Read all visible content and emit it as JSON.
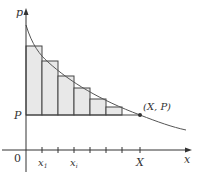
{
  "diagram": {
    "type": "riemann-sum-consumer-surplus",
    "labels": {
      "y_axis": "p",
      "x_axis": "x",
      "origin": "0",
      "price_level": "P",
      "point": "(X, P)",
      "x1": "x",
      "x1_sub": "1",
      "xi": "x",
      "xi_sub": "i",
      "X": "X"
    },
    "colors": {
      "axis": "#333333",
      "curve": "#555555",
      "rect_fill": "#e8e8e8",
      "rect_stroke": "#444444",
      "point": "#333333"
    },
    "rectangles": [
      {
        "x0": 26,
        "x1": 42,
        "top": 46
      },
      {
        "x0": 42,
        "x1": 58,
        "top": 61
      },
      {
        "x0": 58,
        "x1": 74,
        "top": 76
      },
      {
        "x0": 74,
        "x1": 90,
        "top": 88
      },
      {
        "x0": 90,
        "x1": 106,
        "top": 99
      },
      {
        "x0": 106,
        "x1": 122,
        "top": 107
      }
    ],
    "ticks_x": [
      42,
      58,
      74,
      90,
      106,
      122,
      140
    ]
  }
}
